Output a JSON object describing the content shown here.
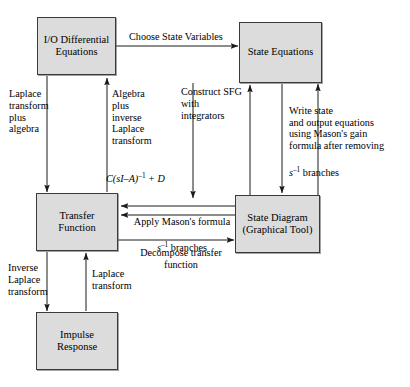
{
  "diagram": {
    "nodes": [
      {
        "id": "io-diff-eq",
        "label": "I/O\nDifferential\nEquations"
      },
      {
        "id": "state-equations",
        "label": "State\nEquations"
      },
      {
        "id": "transfer-function",
        "label": "Transfer\nFunction"
      },
      {
        "id": "state-diagram",
        "label": "State\nDiagram\n(Graphical Tool)"
      },
      {
        "id": "impulse-response",
        "label": "Impulse\nResponse"
      }
    ],
    "edge_labels": {
      "choose_state_variables": "Choose State Variables",
      "laplace_plus_algebra": "Laplace\ntransform\nplus\nalgebra",
      "algebra_plus_inverse_laplace": "Algebra\nplus\ninverse\nLaplace\ntransform",
      "transfer_formula_prefix": "C(sI–A)",
      "transfer_formula_exp": "–1",
      "transfer_formula_suffix": " + D",
      "construct_sfg": "Construct SFG\nwith\nintegrators",
      "write_state_output": "Write state\nand output equations\nusing Mason's gain\nformula after removing",
      "write_state_output_tail_var": "s",
      "write_state_output_tail_exp": "–1",
      "write_state_output_tail_rest": " branches",
      "apply_masons_line1": "Apply Mason's formula",
      "apply_masons_var": "s",
      "apply_masons_exp": "–1",
      "apply_masons_rest": " branches",
      "decompose_transfer": "Decompose transfer\nfunction",
      "inverse_laplace": "Inverse\nLaplace\ntransform",
      "laplace_transform": "Laplace\ntransform"
    },
    "colors": {
      "node_fill": "#dcdcdc",
      "node_border": "#3a3a3a",
      "wire": "#1a1a1a",
      "text": "#000000",
      "background": "#ffffff"
    }
  }
}
